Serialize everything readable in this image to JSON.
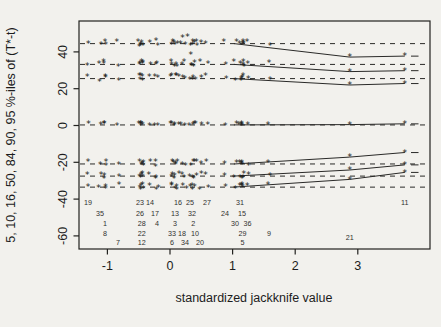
{
  "chart_data": {
    "type": "scatter",
    "subtype": "jackknife-after-bootstrap",
    "title": "",
    "xlabel": "standardized jackknife value",
    "ylabel": "5, 10, 16, 50, 84, 90, 95 %-iles of (T*-t)",
    "xlim": [
      -1.45,
      4.15
    ],
    "ylim": [
      -67,
      57
    ],
    "grid": false,
    "legend": "none",
    "x_ticks": [
      -1,
      0,
      1,
      2,
      3
    ],
    "x_tick_labels": [
      "-1",
      "0",
      "1",
      "2",
      "3"
    ],
    "y_ticks": [
      40,
      20,
      0,
      -20,
      -40,
      -60
    ],
    "y_tick_labels": [
      "40",
      "20",
      "0",
      "-20",
      "-40",
      "-60"
    ],
    "percentiles": [
      {
        "pct": 95,
        "overall": 44.5,
        "case21": 37.2,
        "case11": 37.7
      },
      {
        "pct": 90,
        "overall": 33.2,
        "case21": 29.3,
        "case11": 29.8
      },
      {
        "pct": 84,
        "overall": 25.5,
        "case21": 22.0,
        "case11": 22.8
      },
      {
        "pct": 50,
        "overall": 0.3,
        "case21": 0.5,
        "case11": 0.9
      },
      {
        "pct": 16,
        "overall": -20.9,
        "case21": -17.2,
        "case11": -14.7
      },
      {
        "pct": 10,
        "overall": -27.5,
        "case21": -24.2,
        "case11": -21.4
      },
      {
        "pct": 5,
        "overall": -33.5,
        "case21": -29.3,
        "case11": -25.5
      }
    ],
    "cases": [
      {
        "label": "19",
        "x": -1.31,
        "row": 1
      },
      {
        "label": "35",
        "x": -1.12,
        "row": 2
      },
      {
        "label": "1",
        "x": -1.04,
        "row": 3
      },
      {
        "label": "8",
        "x": -1.04,
        "row": 4
      },
      {
        "label": "7",
        "x": -0.83,
        "row": 5
      },
      {
        "label": "23",
        "x": -0.48,
        "row": 1
      },
      {
        "label": "26",
        "x": -0.48,
        "row": 2
      },
      {
        "label": "28",
        "x": -0.45,
        "row": 3
      },
      {
        "label": "22",
        "x": -0.45,
        "row": 4
      },
      {
        "label": "12",
        "x": -0.45,
        "row": 5
      },
      {
        "label": "14",
        "x": -0.32,
        "row": 1
      },
      {
        "label": "17",
        "x": -0.24,
        "row": 2
      },
      {
        "label": "4",
        "x": -0.21,
        "row": 3
      },
      {
        "label": "33",
        "x": 0.03,
        "row": 4
      },
      {
        "label": "6",
        "x": 0.03,
        "row": 5
      },
      {
        "label": "13",
        "x": 0.08,
        "row": 2
      },
      {
        "label": "3",
        "x": 0.08,
        "row": 3
      },
      {
        "label": "16",
        "x": 0.13,
        "row": 1
      },
      {
        "label": "18",
        "x": 0.19,
        "row": 4
      },
      {
        "label": "34",
        "x": 0.24,
        "row": 5
      },
      {
        "label": "25",
        "x": 0.32,
        "row": 1
      },
      {
        "label": "32",
        "x": 0.35,
        "row": 2
      },
      {
        "label": "2",
        "x": 0.37,
        "row": 3
      },
      {
        "label": "10",
        "x": 0.4,
        "row": 4
      },
      {
        "label": "20",
        "x": 0.48,
        "row": 5
      },
      {
        "label": "27",
        "x": 0.59,
        "row": 1
      },
      {
        "label": "24",
        "x": 0.88,
        "row": 2
      },
      {
        "label": "30",
        "x": 1.04,
        "row": 3
      },
      {
        "label": "31",
        "x": 1.12,
        "row": 1
      },
      {
        "label": "15",
        "x": 1.15,
        "row": 2
      },
      {
        "label": "29",
        "x": 1.16,
        "row": 4
      },
      {
        "label": "5",
        "x": 1.16,
        "row": 5
      },
      {
        "label": "36",
        "x": 1.24,
        "row": 3
      },
      {
        "label": "9",
        "x": 1.58,
        "row": 4
      },
      {
        "label": "21",
        "x": 2.87,
        "row": 6,
        "special": "case21"
      },
      {
        "label": "11",
        "x": 3.75,
        "row": 1,
        "special": "case11"
      }
    ],
    "outlier_points": [
      {
        "x": -0.51,
        "v": 45.5
      },
      {
        "x": 0.2,
        "v": 47.5
      },
      {
        "x": 0.28,
        "v": 48.5
      },
      {
        "x": 0.36,
        "v": 44.0
      },
      {
        "x": 0.33,
        "v": 38.5
      },
      {
        "x": 0.43,
        "v": 43.5
      }
    ]
  }
}
